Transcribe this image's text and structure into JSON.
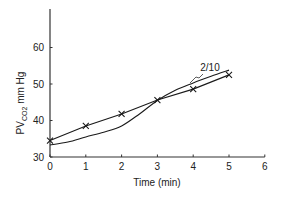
{
  "chart_data": {
    "type": "line",
    "title": "",
    "xlabel": "Time (min)",
    "ylabel": "PVCO2 mm Hg",
    "ylabel_parts": {
      "main": "PV",
      "sub": "CO2",
      "unit": " mm Hg"
    },
    "xlim": [
      0,
      6
    ],
    "ylim": [
      30,
      69
    ],
    "xticks": [
      0,
      1,
      2,
      3,
      4,
      5,
      6
    ],
    "yticks": [
      30,
      40,
      50,
      60
    ],
    "xtick_labels": [
      "0",
      "1",
      "2",
      "3",
      "4",
      "5",
      "6"
    ],
    "ytick_labels": [
      "30",
      "40",
      "50",
      "60"
    ],
    "grid": false,
    "legend": null,
    "series": [
      {
        "name": "measured",
        "marker": "x",
        "x": [
          0,
          1,
          2,
          3,
          4,
          5
        ],
        "y": [
          34.5,
          38.5,
          41.8,
          45.6,
          48.6,
          52.5
        ]
      },
      {
        "name": "2/10",
        "marker": "none",
        "smooth": true,
        "x": [
          0,
          0.5,
          1,
          1.5,
          2,
          2.5,
          3,
          3.5,
          4,
          4.5,
          5
        ],
        "y": [
          33.3,
          34.1,
          35.5,
          36.8,
          38.5,
          41.8,
          45.5,
          48.3,
          50.3,
          52.1,
          53.8
        ]
      }
    ],
    "annotations": [
      {
        "text": "2/10",
        "x": 4.4,
        "y": 53.0,
        "points_to": "smooth curve near x=3.9"
      }
    ],
    "colors": {
      "line": "#1a1a1a",
      "axis": "#333333",
      "background": "#ffffff"
    }
  }
}
